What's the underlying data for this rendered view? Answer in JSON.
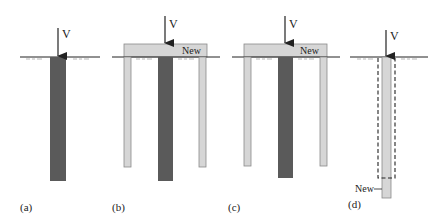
{
  "colors": {
    "existing_pile": "#5a5a5a",
    "new_member": "#d6d6d6",
    "new_member_stroke": "#8a8a8a",
    "line": "#222222",
    "soil_hatch": "#777777"
  },
  "panels": [
    {
      "id": "a",
      "caption": "(a)",
      "load_label": "V"
    },
    {
      "id": "b",
      "caption": "(b)",
      "load_label": "V",
      "new_label": "New"
    },
    {
      "id": "c",
      "caption": "(c)",
      "load_label": "V",
      "new_label": "New"
    },
    {
      "id": "d",
      "caption": "(d)",
      "load_label": "V",
      "new_label": "New"
    }
  ]
}
